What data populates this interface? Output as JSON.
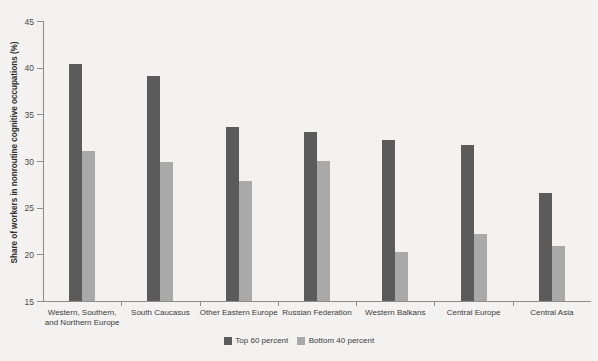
{
  "chart_data": {
    "type": "bar",
    "title": "",
    "xlabel": "",
    "ylabel": "Share of workers in nonroutine cognitive occupations (%)",
    "ylim": [
      15,
      45
    ],
    "ytick_values": [
      15,
      20,
      25,
      30,
      35,
      40,
      45
    ],
    "ytick_labels": [
      "15",
      "20",
      "25",
      "30",
      "35",
      "40",
      "45"
    ],
    "grid": false,
    "legend_position": "bottom-center",
    "categories": [
      "Western, Southern,\nand Northern Europe",
      "South Caucasus",
      "Other Eastern Europe",
      "Russian Federation",
      "Western Balkans",
      "Central Europe",
      "Central Asia"
    ],
    "series": [
      {
        "name": "Top 60 percent",
        "color": "#5b5b5b",
        "values": [
          40.4,
          39.1,
          33.6,
          33.1,
          32.3,
          31.7,
          26.6
        ]
      },
      {
        "name": "Bottom 40 percent",
        "color": "#a9a9a9",
        "values": [
          31.1,
          29.9,
          27.9,
          30.0,
          20.2,
          22.2,
          20.9
        ]
      }
    ]
  },
  "colors": {
    "background": "#f3f2f0",
    "axis": "#8d8d8d",
    "text": "#3b3b3b",
    "series_top60": "#5b5b5b",
    "series_bottom40": "#a9a9a9"
  }
}
